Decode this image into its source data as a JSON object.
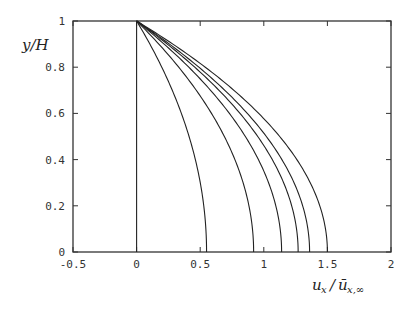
{
  "chart_data": {
    "type": "line",
    "title": "",
    "xlabel": "u_x / ū_x,∞",
    "ylabel": "y/H",
    "xlim": [
      -0.5,
      2
    ],
    "ylim": [
      0,
      1
    ],
    "grid": false,
    "legend": null,
    "x_ticks": [
      -0.5,
      0,
      0.5,
      1,
      1.5,
      2
    ],
    "x_tick_labels": [
      "-0.5",
      "0",
      "0.5",
      "1",
      "1.5",
      "2"
    ],
    "y_ticks": [
      0,
      0.2,
      0.4,
      0.6,
      0.8,
      1
    ],
    "y_tick_labels": [
      "0",
      "0.2",
      "0.4",
      "0.6",
      "0.8",
      "1"
    ],
    "curve_form": "u = U * (1 - (y/H)^2)",
    "series": [
      {
        "name": "profile-0",
        "max_u": 0.0
      },
      {
        "name": "profile-1",
        "max_u": 0.55
      },
      {
        "name": "profile-2",
        "max_u": 0.92
      },
      {
        "name": "profile-3",
        "max_u": 1.14
      },
      {
        "name": "profile-4",
        "max_u": 1.27
      },
      {
        "name": "profile-5",
        "max_u": 1.36
      },
      {
        "name": "profile-6",
        "max_u": 1.5
      }
    ]
  },
  "labels": {
    "y_axis": "y/H",
    "x_axis_main": "u",
    "x_axis_sub1": "x",
    "x_axis_over": "ū",
    "x_axis_sub2": "x,∞"
  }
}
